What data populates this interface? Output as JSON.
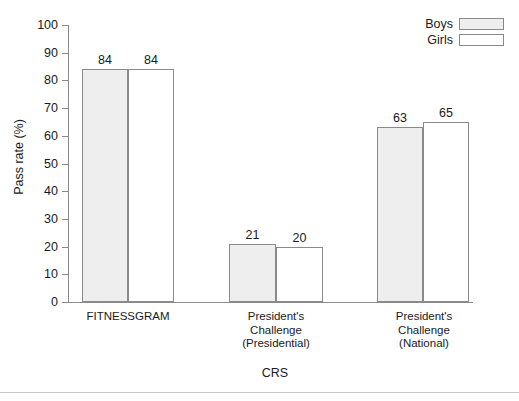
{
  "chart_data": {
    "type": "bar",
    "title": "",
    "xlabel": "CRS",
    "ylabel": "Pass rate (%)",
    "ylim": [
      0,
      100
    ],
    "ytick_labels": [
      "0",
      "10",
      "20",
      "30",
      "40",
      "50",
      "60",
      "70",
      "80",
      "90",
      "100"
    ],
    "yticks": [
      0,
      10,
      20,
      30,
      40,
      50,
      60,
      70,
      80,
      90,
      100
    ],
    "grid": false,
    "legend_position": "top-right",
    "categories": [
      "FITNESSGRAM",
      "President's\nChallenge\n(Presidential)",
      "President's\nChallenge\n(National)"
    ],
    "series": [
      {
        "name": "Boys",
        "color": "#eeeeee",
        "values": [
          84,
          21,
          63
        ],
        "value_labels": [
          "84",
          "21",
          "63"
        ]
      },
      {
        "name": "Girls",
        "color": "#ffffff",
        "values": [
          84,
          20,
          65
        ],
        "value_labels": [
          "84",
          "20",
          "65"
        ]
      }
    ]
  },
  "legend": {
    "items": [
      {
        "label": "Boys",
        "swatch": "boys-swatch"
      },
      {
        "label": "Girls",
        "swatch": "girls-swatch"
      }
    ]
  },
  "axes": {
    "y_title": "Pass rate (%)",
    "x_title": "CRS"
  }
}
